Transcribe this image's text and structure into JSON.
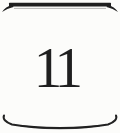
{
  "page": {
    "number": "11"
  },
  "ornaments": {
    "top": "thick-horizontal-rule-with-downward-curled-swash-ends",
    "bottom": "thin-arc-rule-with-upward-curled-ends"
  },
  "colors": {
    "ink": "#1f1f1f",
    "paper": "#fcfcfa"
  }
}
